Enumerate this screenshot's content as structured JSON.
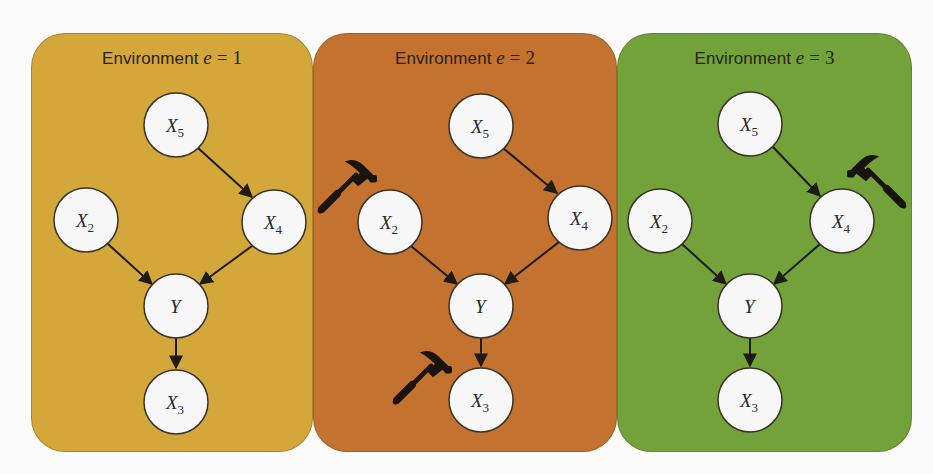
{
  "figure": {
    "background": "#fbfbfb",
    "node_fill": "#f7f7f7",
    "node_stroke": "#3a3328",
    "edge_color": "#1e1a14",
    "panels": [
      {
        "title_prefix": "Environment ",
        "title_var": "e",
        "title_eq": " = ",
        "title_value": "1",
        "color": "#D4A73A",
        "interventions": []
      },
      {
        "title_prefix": "Environment ",
        "title_var": "e",
        "title_eq": " = ",
        "title_value": "2",
        "color": "#C3722F",
        "interventions": [
          "X2",
          "X3"
        ]
      },
      {
        "title_prefix": "Environment ",
        "title_var": "e",
        "title_eq": " = ",
        "title_value": "3",
        "color": "#73A23A",
        "interventions": [
          "X4"
        ]
      }
    ],
    "nodes": [
      {
        "id": "X5",
        "base": "X",
        "sub": "5"
      },
      {
        "id": "X2",
        "base": "X",
        "sub": "2"
      },
      {
        "id": "X4",
        "base": "X",
        "sub": "4"
      },
      {
        "id": "Y",
        "base": "Y",
        "sub": ""
      },
      {
        "id": "X3",
        "base": "X",
        "sub": "3"
      }
    ],
    "edges": [
      {
        "from": "X5",
        "to": "X4"
      },
      {
        "from": "X2",
        "to": "Y"
      },
      {
        "from": "X4",
        "to": "Y"
      },
      {
        "from": "Y",
        "to": "X3"
      }
    ],
    "intervention_icon": "hammer-icon"
  }
}
